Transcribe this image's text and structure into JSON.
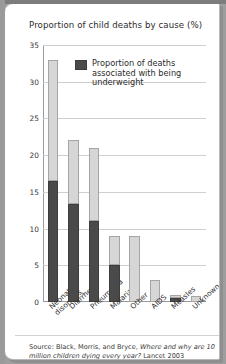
{
  "chart_data": {
    "type": "bar",
    "title": "Proportion of child deaths by cause (%)",
    "xlabel": "",
    "ylabel": "",
    "ylim": [
      0,
      35
    ],
    "yticks": [
      0,
      5,
      10,
      15,
      20,
      25,
      30,
      35
    ],
    "grid": true,
    "stacked": true,
    "legend_position": "top-center",
    "categories": [
      "Neonatal\ndisorders",
      "Diarrhea",
      "Pneumonia",
      "Malaria",
      "Other",
      "AIDS",
      "Measles",
      "Unknown"
    ],
    "series": [
      {
        "name": "Proportion of deaths associated with being underweight",
        "color": "#4a4a4a",
        "values": [
          16.5,
          13.4,
          11.1,
          5.1,
          0,
          0,
          0.5,
          0
        ]
      },
      {
        "name": "Total proportion of child deaths",
        "color": "#d6d6d6",
        "values": [
          33,
          22,
          21,
          9,
          9,
          3,
          1,
          0.8
        ]
      }
    ]
  },
  "legend": {
    "label": "Proportion of deaths associated with being underweight",
    "swatch_color": "#4a4a4a"
  },
  "source": {
    "prefix": "Source: Black, Morris, and Bryce, ",
    "italic": "Where and why are 10 million children dying every year?",
    "suffix": " Lancet 2003"
  },
  "colors": {
    "light_bar": "#d6d6d6",
    "dark_bar": "#4a4a4a",
    "grid": "#cfcfcf",
    "axis": "#9a9a9a",
    "page_background": "#9e9e9e",
    "card_background": "#ffffff"
  }
}
